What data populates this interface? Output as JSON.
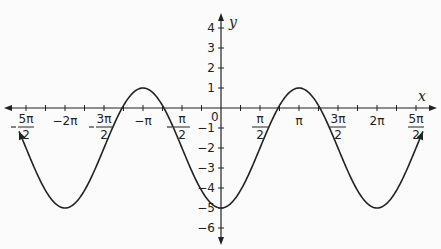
{
  "chart_data": {
    "type": "line",
    "title": "",
    "function": "y = -3cos(x) - 2",
    "xlabel": "x",
    "ylabel": "y",
    "xlim": [
      -7.854,
      7.854
    ],
    "ylim": [
      -6,
      4
    ],
    "grid": false,
    "x_tick_step": "π/4",
    "x_tick_labels": [
      {
        "value": -7.854,
        "num": "5π",
        "den": "2",
        "neg": true
      },
      {
        "value": -6.283,
        "text": "−2π"
      },
      {
        "value": -4.712,
        "num": "3π",
        "den": "2",
        "neg": true
      },
      {
        "value": -3.1416,
        "text": "−π"
      },
      {
        "value": -1.5708,
        "num": "π",
        "den": "2",
        "neg": true
      },
      {
        "value": 1.5708,
        "num": "π",
        "den": "2",
        "neg": false
      },
      {
        "value": 3.1416,
        "text": "π"
      },
      {
        "value": 4.712,
        "num": "3π",
        "den": "2",
        "neg": false
      },
      {
        "value": 6.283,
        "text": "2π"
      },
      {
        "value": 7.854,
        "num": "5π",
        "den": "2",
        "neg": false
      }
    ],
    "y_tick_labels": [
      "4",
      "3",
      "2",
      "1",
      "−1",
      "−2",
      "−3",
      "−4",
      "−5",
      "−6"
    ],
    "origin_label": "0",
    "series": [
      {
        "name": "y = -3cos(x) - 2",
        "x": [
          -7.854,
          -6.283,
          -4.712,
          -3.1416,
          -1.5708,
          0,
          1.5708,
          3.1416,
          4.712,
          6.283,
          7.854
        ],
        "y": [
          -2,
          -5,
          -2,
          1,
          -2,
          -5,
          -2,
          1,
          -2,
          -5,
          -2
        ]
      }
    ],
    "key_points": {
      "maxima": [
        [
          -3.1416,
          1
        ],
        [
          3.1416,
          1
        ]
      ],
      "minima": [
        [
          -6.283,
          -5
        ],
        [
          0,
          -5
        ],
        [
          6.283,
          -5
        ]
      ]
    }
  },
  "axes": {
    "x_label": "x",
    "y_label": "y",
    "origin": "0"
  },
  "colors": {
    "curve": "#222222",
    "axis": "#222222",
    "background": "#fbfbfb"
  }
}
